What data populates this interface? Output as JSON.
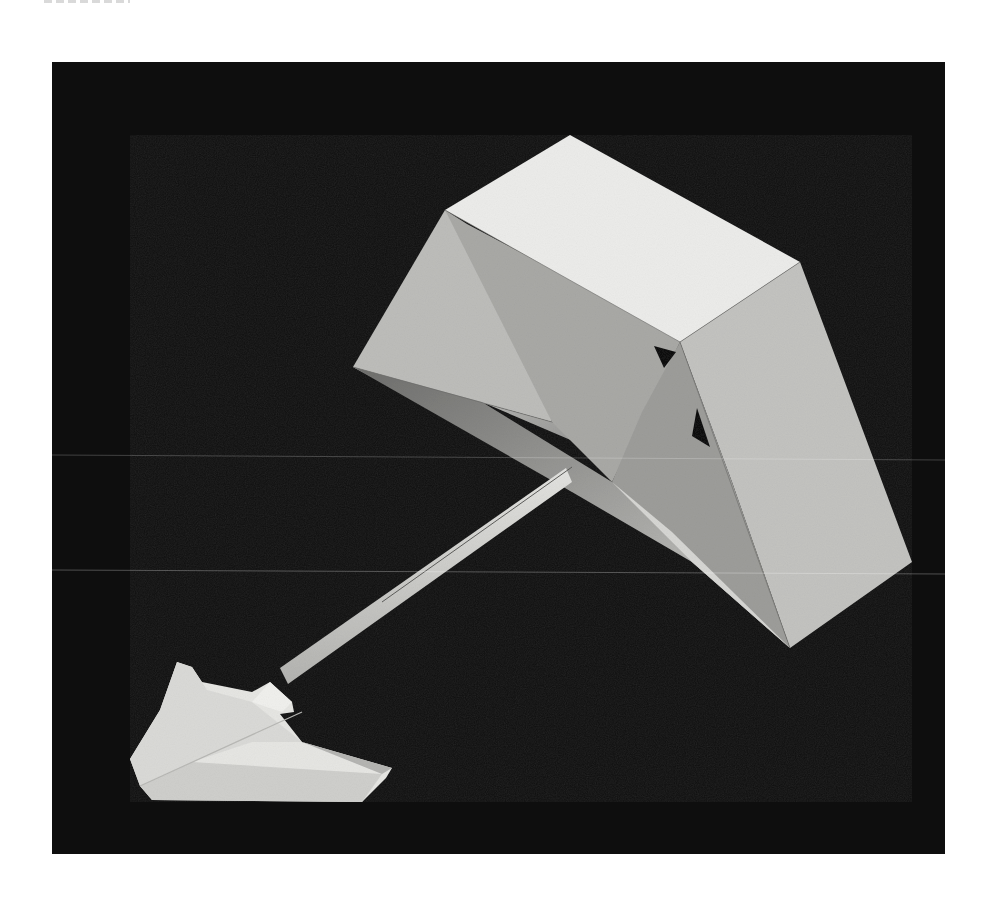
{
  "page": {
    "background": "#ffffff"
  },
  "photo": {
    "subject": "folded white paper arrow sculpture on black background",
    "background_color": "#0e0e0e",
    "paper_colors": {
      "highlight": "#ececea",
      "light": "#d9d9d6",
      "mid": "#bdbdba",
      "shadow": "#8e8e8c",
      "deep_shadow": "#6c6c6a"
    },
    "frame": {
      "left": 52,
      "top": 62,
      "right": 945,
      "bottom": 854
    }
  }
}
